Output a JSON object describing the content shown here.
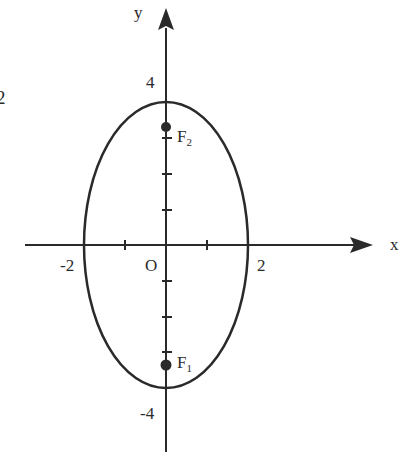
{
  "diagram": {
    "type": "ellipse-with-foci",
    "colors": {
      "stroke": "#2a2a2a",
      "background": "#ffffff"
    },
    "axes": {
      "x_label": "x",
      "y_label": "y",
      "origin_label": "O",
      "x_ticks": [
        "-2",
        "2"
      ],
      "y_ticks": [
        "4",
        "-4"
      ]
    },
    "ellipse": {
      "center": [
        0,
        0
      ],
      "semi_axis_x": 2,
      "semi_axis_y": 3.5
    },
    "foci": [
      {
        "label": "F",
        "subscript": "2",
        "position": [
          0,
          3
        ]
      },
      {
        "label": "F",
        "subscript": "1",
        "position": [
          0,
          -3
        ]
      }
    ],
    "edge_fragment": "2"
  }
}
